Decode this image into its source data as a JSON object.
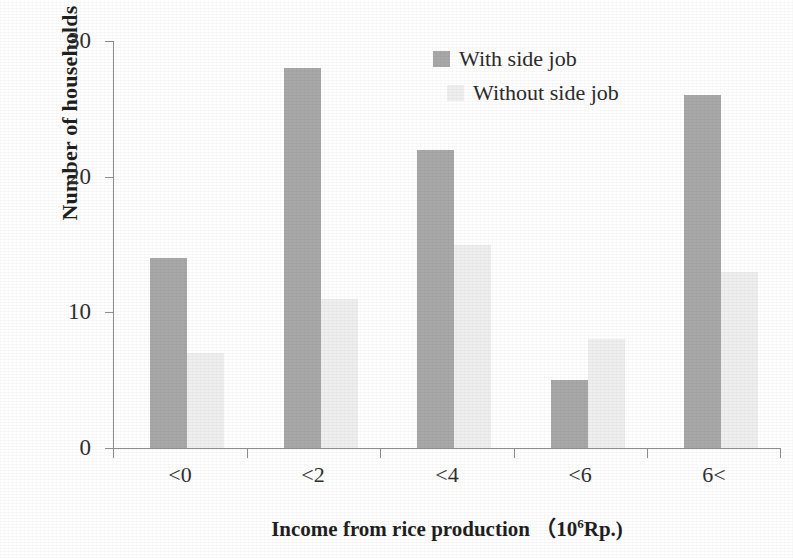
{
  "chart_data": {
    "type": "bar",
    "title": "",
    "subtitle": "",
    "categories": [
      "<0",
      "<2",
      "<4",
      "<6",
      "6<"
    ],
    "series": [
      {
        "name": "With side job",
        "values": [
          14,
          28,
          22,
          5,
          26
        ],
        "color": "#a8a8a8"
      },
      {
        "name": "Without side job",
        "values": [
          7,
          11,
          15,
          8,
          13
        ],
        "color": "#efefef"
      }
    ],
    "xlabel_plain": "Income from rice production （106Rp.)",
    "xlabel_prefix": "Income from rice production （10",
    "xlabel_superscript": "6",
    "xlabel_suffix": "Rp.)",
    "ylabel": "Number of households",
    "ylim": [
      0,
      30
    ],
    "yticks": [
      0,
      10,
      20,
      30
    ],
    "ytick_labels": [
      "0",
      "10",
      "20",
      "30"
    ],
    "grid": false,
    "legend_position": "top-center-right",
    "legend": [
      {
        "label": "With side job",
        "swatch": "#a8a8a8"
      },
      {
        "label": "Without side job",
        "swatch": "#efefef"
      }
    ]
  },
  "axes": {
    "y_title": "Number of households",
    "y_tick_0": "0",
    "y_tick_10": "10",
    "y_tick_20": "20",
    "y_tick_30": "30",
    "x_cat_0": "<0",
    "x_cat_1": "<2",
    "x_cat_2": "<4",
    "x_cat_3": "<6",
    "x_cat_4": "6<"
  },
  "legend": {
    "item_a": "With side job",
    "item_b": "Without side job"
  }
}
